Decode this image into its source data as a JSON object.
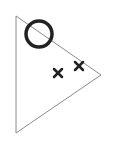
{
  "diagram": {
    "background": "#ffffff",
    "triangle": {
      "points": [
        [
          16,
          16
        ],
        [
          101,
          75
        ],
        [
          16,
          133
        ]
      ],
      "stroke": "#8a8a8a",
      "stroke_width": 1
    },
    "circle": {
      "cx": 39,
      "cy": 34,
      "r": 13,
      "stroke": "#222222",
      "stroke_width": 3.5
    },
    "crosses": [
      {
        "cx": 58,
        "cy": 73,
        "size": 8,
        "stroke": "#222222",
        "stroke_width": 2.5
      },
      {
        "cx": 79,
        "cy": 66,
        "size": 8,
        "stroke": "#222222",
        "stroke_width": 2.5
      }
    ]
  }
}
